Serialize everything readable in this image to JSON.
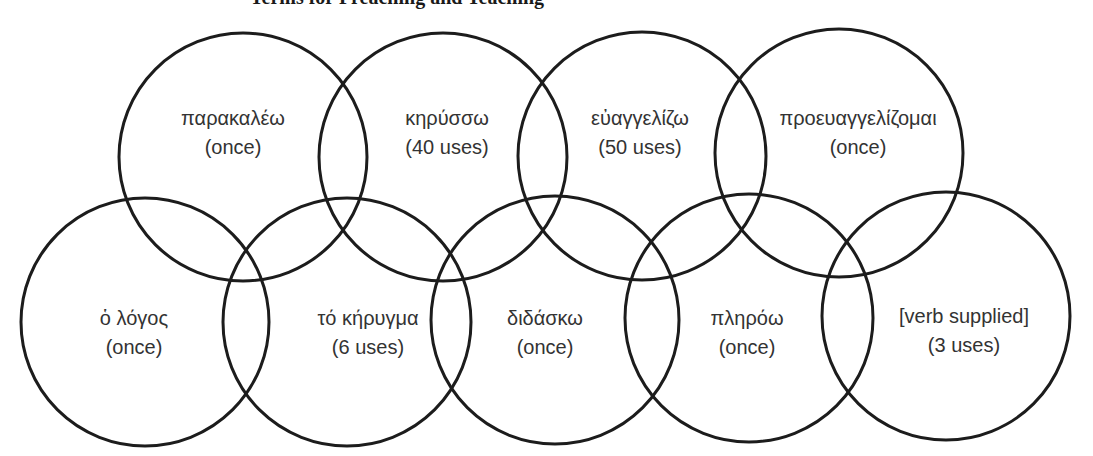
{
  "title": "Terms for Preaching and Teaching",
  "style": {
    "stroke_color": "#1c1c1c",
    "text_color": "#333333",
    "background": "#ffffff"
  },
  "circles": [
    {
      "term": "παρακαλέω",
      "count": "(once)",
      "cx": 243,
      "cy": 157,
      "r": 124,
      "lx": 233,
      "ly": 104
    },
    {
      "term": "κηρύσσω",
      "count": "(40 uses)",
      "cx": 443,
      "cy": 157,
      "r": 124,
      "lx": 447,
      "ly": 104
    },
    {
      "term": "εὐαγγελίζω",
      "count": "(50 uses)",
      "cx": 642,
      "cy": 156,
      "r": 124,
      "lx": 640,
      "ly": 104
    },
    {
      "term": "προευαγγελίζομαι",
      "count": "(once)",
      "cx": 839,
      "cy": 153,
      "r": 124,
      "lx": 858,
      "ly": 104
    },
    {
      "term": "ὁ λόγος",
      "count": "(once)",
      "cx": 145,
      "cy": 322,
      "r": 124,
      "lx": 134,
      "ly": 304
    },
    {
      "term": "τό κήρυγμα",
      "count": "(6 uses)",
      "cx": 347,
      "cy": 322,
      "r": 124,
      "lx": 368,
      "ly": 304
    },
    {
      "term": "διδάσκω",
      "count": "(once)",
      "cx": 555,
      "cy": 320,
      "r": 124,
      "lx": 545,
      "ly": 304
    },
    {
      "term": "πληρόω",
      "count": "(once)",
      "cx": 749,
      "cy": 318,
      "r": 124,
      "lx": 747,
      "ly": 304
    },
    {
      "term": "[verb supplied]",
      "count": "(3 uses)",
      "cx": 946,
      "cy": 316,
      "r": 124,
      "lx": 964,
      "ly": 302
    }
  ]
}
